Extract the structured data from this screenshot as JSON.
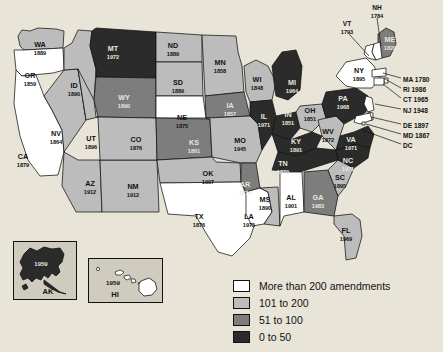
{
  "map": {
    "title": "State constitutions: year adopted and number of amendments",
    "legend": {
      "name": "amendment-count-legend",
      "items": [
        {
          "label": "More than 200 amendments",
          "color": "#ffffff",
          "band": "200+"
        },
        {
          "label": "101 to 200",
          "color": "#bcbcbc",
          "band": "101-200"
        },
        {
          "label": "51 to 100",
          "color": "#7d7d7d",
          "band": "51-100"
        },
        {
          "label": "0 to 50",
          "color": "#2b2b2b",
          "band": "0-50"
        }
      ]
    },
    "states": [
      {
        "abbr": "WA",
        "year": "1889",
        "band": "101-200",
        "x": 40,
        "y": 47
      },
      {
        "abbr": "OR",
        "year": "1859",
        "band": "200+",
        "x": 30,
        "y": 78
      },
      {
        "abbr": "CA",
        "year": "1879",
        "band": "200+",
        "x": 23,
        "y": 159
      },
      {
        "abbr": "NV",
        "year": "1864",
        "band": "101-200",
        "x": 56,
        "y": 136
      },
      {
        "abbr": "ID",
        "year": "1890",
        "band": "101-200",
        "x": 74,
        "y": 88
      },
      {
        "abbr": "MT",
        "year": "1972",
        "band": "0-50",
        "x": 113,
        "y": 51
      },
      {
        "abbr": "WY",
        "year": "1890",
        "band": "51-100",
        "x": 124,
        "y": 100
      },
      {
        "abbr": "UT",
        "year": "1896",
        "band": "101-200",
        "x": 91,
        "y": 141
      },
      {
        "abbr": "AZ",
        "year": "1912",
        "band": "101-200",
        "x": 90,
        "y": 186
      },
      {
        "abbr": "NM",
        "year": "1912",
        "band": "101-200",
        "x": 133,
        "y": 189
      },
      {
        "abbr": "CO",
        "year": "1876",
        "band": "101-200",
        "x": 136,
        "y": 142
      },
      {
        "abbr": "ND",
        "year": "1889",
        "band": "101-200",
        "x": 173,
        "y": 48
      },
      {
        "abbr": "SD",
        "year": "1889",
        "band": "101-200",
        "x": 178,
        "y": 85
      },
      {
        "abbr": "NE",
        "year": "1875",
        "band": "200+",
        "x": 182,
        "y": 120
      },
      {
        "abbr": "KS",
        "year": "1861",
        "band": "51-100",
        "x": 194,
        "y": 145
      },
      {
        "abbr": "OK",
        "year": "1907",
        "band": "101-200",
        "x": 208,
        "y": 176
      },
      {
        "abbr": "TX",
        "year": "1876",
        "band": "200+",
        "x": 199,
        "y": 219
      },
      {
        "abbr": "MN",
        "year": "1858",
        "band": "101-200",
        "x": 220,
        "y": 65
      },
      {
        "abbr": "IA",
        "year": "1857",
        "band": "51-100",
        "x": 230,
        "y": 108
      },
      {
        "abbr": "MO",
        "year": "1945",
        "band": "101-200",
        "x": 240,
        "y": 143
      },
      {
        "abbr": "AR",
        "year": "1874",
        "band": "51-100",
        "x": 245,
        "y": 187
      },
      {
        "abbr": "LA",
        "year": "1975",
        "band": "200+",
        "x": 249,
        "y": 219
      },
      {
        "abbr": "MS",
        "year": "1890",
        "band": "101-200",
        "x": 265,
        "y": 202
      },
      {
        "abbr": "WI",
        "year": "1848",
        "band": "101-200",
        "x": 257,
        "y": 82
      },
      {
        "abbr": "IL",
        "year": "1971",
        "band": "0-50",
        "x": 264,
        "y": 119
      },
      {
        "abbr": "IN",
        "year": "1851",
        "band": "0-50",
        "x": 288,
        "y": 117
      },
      {
        "abbr": "MI",
        "year": "1964",
        "band": "0-50",
        "x": 292,
        "y": 85
      },
      {
        "abbr": "OH",
        "year": "1851",
        "band": "101-200",
        "x": 310,
        "y": 113
      },
      {
        "abbr": "KY",
        "year": "1891",
        "band": "0-50",
        "x": 296,
        "y": 144
      },
      {
        "abbr": "TN",
        "year": "1870",
        "band": "0-50",
        "x": 283,
        "y": 166
      },
      {
        "abbr": "AL",
        "year": "1901",
        "band": "200+",
        "x": 291,
        "y": 200
      },
      {
        "abbr": "GA",
        "year": "1983",
        "band": "51-100",
        "x": 318,
        "y": 200
      },
      {
        "abbr": "FL",
        "year": "1969",
        "band": "101-200",
        "x": 346,
        "y": 233
      },
      {
        "abbr": "SC",
        "year": "1895",
        "band": "101-200",
        "x": 340,
        "y": 180
      },
      {
        "abbr": "NC",
        "year": "1971",
        "band": "0-50",
        "x": 348,
        "y": 163
      },
      {
        "abbr": "VA",
        "year": "1971",
        "band": "0-50",
        "x": 351,
        "y": 142
      },
      {
        "abbr": "WV",
        "year": "1872",
        "band": "101-200",
        "x": 328,
        "y": 134
      },
      {
        "abbr": "PA",
        "year": "1968",
        "band": "0-50",
        "x": 343,
        "y": 101
      },
      {
        "abbr": "NY",
        "year": "1895",
        "band": "200+",
        "x": 359,
        "y": 73
      },
      {
        "abbr": "ME",
        "year": "1820",
        "band": "51-100",
        "x": 390,
        "y": 42
      }
    ],
    "callout_states": [
      {
        "abbr": "VT",
        "year": "1793",
        "label": "VT",
        "year_only": true,
        "x": 347,
        "y": 26,
        "leader": "M349,34 L369,56"
      },
      {
        "abbr": "NH",
        "year": "1784",
        "label": "NH",
        "year_only": true,
        "x": 377,
        "y": 10,
        "leader": "M377,18 L381,46"
      },
      {
        "abbr": "MA",
        "year": "1780",
        "label": "MA 1780",
        "year_only": false,
        "x": 403,
        "y": 80,
        "leader": "M401,78 L383,73"
      },
      {
        "abbr": "RI",
        "year": "1986",
        "label": "RI 1986",
        "year_only": false,
        "x": 403,
        "y": 90,
        "leader": "M401,88 L385,79"
      },
      {
        "abbr": "CT",
        "year": "1965",
        "label": "CT 1965",
        "year_only": false,
        "x": 403,
        "y": 100,
        "leader": "M401,98 L383,84"
      },
      {
        "abbr": "NJ",
        "year": "1948",
        "label": "NJ 1948",
        "year_only": false,
        "x": 403,
        "y": 111,
        "leader": "M401,109 L375,104"
      },
      {
        "abbr": "DE",
        "year": "1897",
        "label": "DE 1897",
        "year_only": false,
        "x": 403,
        "y": 126,
        "leader": "M401,124 L371,117"
      },
      {
        "abbr": "MD",
        "year": "1867",
        "label": "MD 1867",
        "year_only": false,
        "x": 403,
        "y": 136,
        "leader": "M401,134 L366,124"
      },
      {
        "abbr": "DC",
        "year": "",
        "label": "DC",
        "year_only": false,
        "x": 403,
        "y": 146,
        "leader": "M401,144 L362,130"
      }
    ],
    "insets": [
      {
        "abbr": "AK",
        "year": "1959",
        "band": "0-50"
      },
      {
        "abbr": "HI",
        "year": "1959",
        "band": "200+"
      }
    ]
  }
}
